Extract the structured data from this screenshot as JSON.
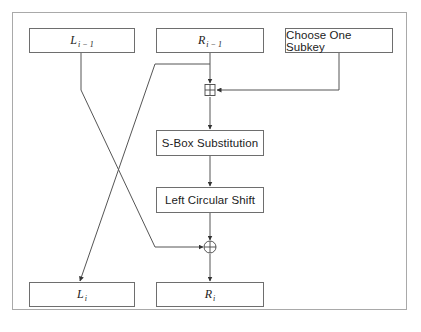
{
  "diagram": {
    "type": "feistel-round-flow",
    "colors": {
      "frame": "#a9a9a9",
      "box_border": "#6e6e6e",
      "line": "#555555",
      "text": "#222222",
      "background": "#ffffff"
    },
    "nodes": {
      "l_prev": {
        "base": "L",
        "sub": "i − 1"
      },
      "r_prev": {
        "base": "R",
        "sub": "i − 1"
      },
      "subkey": {
        "label": "Choose One Subkey"
      },
      "sbox": {
        "label": "S-Box Substitution"
      },
      "shift": {
        "label": "Left Circular Shift"
      },
      "l_next": {
        "base": "L",
        "sub": "i"
      },
      "r_next": {
        "base": "R",
        "sub": "i"
      }
    },
    "operators": {
      "add": {
        "symbol": "boxed-plus",
        "meaning": "modular addition"
      },
      "xor": {
        "symbol": "circled-plus",
        "meaning": "XOR"
      }
    },
    "edges": [
      {
        "from": "R_{i-1}",
        "to": "boxed-plus"
      },
      {
        "from": "Choose One Subkey",
        "to": "boxed-plus"
      },
      {
        "from": "R_{i-1}",
        "to": "L_i"
      },
      {
        "from": "boxed-plus",
        "to": "S-Box Substitution"
      },
      {
        "from": "S-Box Substitution",
        "to": "Left Circular Shift"
      },
      {
        "from": "Left Circular Shift",
        "to": "circled-plus"
      },
      {
        "from": "L_{i-1}",
        "to": "circled-plus"
      },
      {
        "from": "circled-plus",
        "to": "R_i"
      }
    ]
  }
}
